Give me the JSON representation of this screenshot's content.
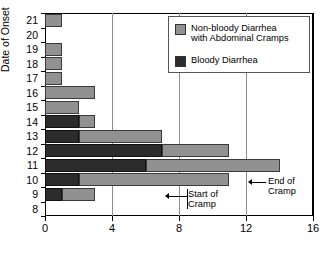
{
  "chart_data": {
    "type": "bar",
    "orientation": "horizontal",
    "title": "",
    "xlabel": "",
    "ylabel": "Date of Onset",
    "xlim": [
      0,
      16
    ],
    "ylim": [
      8,
      21
    ],
    "xticks": [
      0,
      4,
      8,
      12,
      16
    ],
    "yticks": [
      8,
      9,
      10,
      11,
      12,
      13,
      14,
      15,
      16,
      17,
      18,
      19,
      20,
      21
    ],
    "grid": "vertical",
    "stacked": true,
    "legend_position": "top-right",
    "categories": [
      21,
      20,
      19,
      18,
      17,
      16,
      15,
      14,
      13,
      12,
      11,
      10,
      9,
      8
    ],
    "series": [
      {
        "name": "Bloody Diarrhea",
        "color": "#2c2c2c",
        "values": [
          0,
          0,
          0,
          0,
          0,
          0,
          0,
          2,
          2,
          7,
          6,
          2,
          1,
          0
        ]
      },
      {
        "name": "Non-bloody Diarrhea with Abdominal Cramps",
        "color": "#919191",
        "values": [
          1,
          0,
          1,
          1,
          1,
          3,
          2,
          1,
          5,
          4,
          8,
          9,
          2,
          0
        ]
      }
    ],
    "totals": [
      1,
      0,
      1,
      1,
      1,
      3,
      2,
      3,
      7,
      11,
      14,
      11,
      3,
      0
    ],
    "annotations": [
      {
        "text_line1": "Start of",
        "text_line2": "Cramp",
        "points_to_x": 7
      },
      {
        "text_line1": "End of",
        "text_line2": "Cramp",
        "points_to_x": 12
      }
    ]
  },
  "axis": {
    "y_title": "Date of Onset",
    "y_labels": [
      "21",
      "20",
      "19",
      "18",
      "17",
      "16",
      "15",
      "14",
      "13",
      "12",
      "11",
      "10",
      "9",
      "8"
    ],
    "x_labels": [
      "0",
      "4",
      "8",
      "12",
      "16"
    ]
  },
  "legend": {
    "items": [
      {
        "line1": "Non-bloody Diarrhea",
        "line2": "with Abdominal Cramps",
        "color": "#919191"
      },
      {
        "line1": "Bloody Diarrhea",
        "line2": "",
        "color": "#2c2c2c"
      }
    ]
  },
  "annotations": {
    "start": {
      "line1": "Start of",
      "line2": "Cramp"
    },
    "end": {
      "line1": "End of",
      "line2": "Cramp"
    }
  },
  "colors": {
    "nonbloody": "#919191",
    "bloody": "#2c2c2c",
    "axis": "#000000",
    "grid": "#8e8e8e"
  }
}
